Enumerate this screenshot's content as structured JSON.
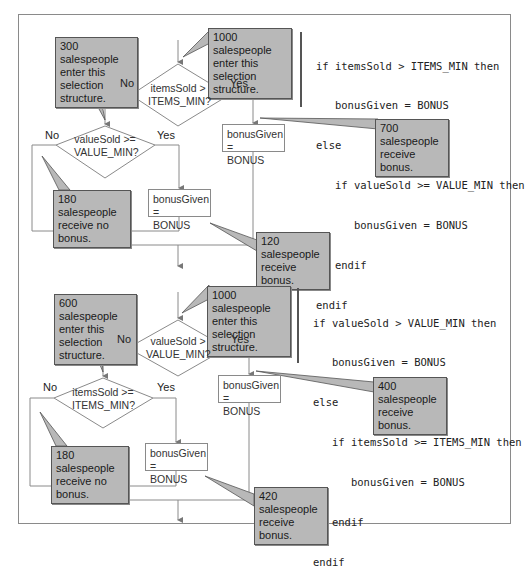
{
  "diagram_top": {
    "entry_callout": "1000 salespeople enter this selection structure.",
    "outer_condition": "itemsSold > ITEMS_MIN?",
    "outer_condition_lines": [
      "itemsSold >",
      "ITEMS_MIN?"
    ],
    "outer_no": "No",
    "outer_yes": "Yes",
    "outer_yes_action_lines": [
      "bonusGiven =",
      "BONUS"
    ],
    "outer_yes_callout_lines": [
      "700 salespeople",
      "receive bonus."
    ],
    "inner_entry_callout_lines": [
      "300 salespeople",
      "enter this selection",
      "structure."
    ],
    "inner_condition_lines": [
      "valueSold >=",
      "VALUE_MIN?"
    ],
    "inner_no": "No",
    "inner_yes": "Yes",
    "inner_yes_action_lines": [
      "bonusGiven =",
      "BONUS"
    ],
    "inner_no_callout_lines": [
      "180 salespeople",
      "receive no bonus."
    ],
    "inner_yes_callout_lines": [
      "120 salespeople",
      "receive bonus."
    ],
    "entry_callout_lines": [
      "1000 salespeople",
      "enter this selection",
      "structure."
    ],
    "pseudocode": [
      "if itemsSold > ITEMS_MIN then",
      "   bonusGiven = BONUS",
      "else",
      "   if valueSold >= VALUE_MIN then",
      "      bonusGiven = BONUS",
      "   endif",
      "endif"
    ]
  },
  "diagram_bottom": {
    "entry_callout_lines": [
      "1000 salespeople",
      "enter this selection",
      "structure."
    ],
    "outer_condition_lines": [
      "valueSold >",
      "VALUE_MIN?"
    ],
    "outer_no": "No",
    "outer_yes": "Yes",
    "outer_yes_action_lines": [
      "bonusGiven =",
      "BONUS"
    ],
    "outer_yes_callout_lines": [
      "400 salespeople",
      "receive bonus."
    ],
    "inner_entry_callout_lines": [
      "600 salespeople",
      "enter this selection",
      "structure."
    ],
    "inner_condition_lines": [
      "itemsSold >=",
      "ITEMS_MIN?"
    ],
    "inner_no": "No",
    "inner_yes": "Yes",
    "inner_yes_action_lines": [
      "bonusGiven =",
      "BONUS"
    ],
    "inner_no_callout_lines": [
      "180 salespeople",
      "receive no bonus."
    ],
    "inner_yes_callout_lines": [
      "420 salespeople",
      "receive bonus."
    ],
    "pseudocode": [
      "if valueSold > VALUE_MIN then",
      "   bonusGiven = BONUS",
      "else",
      "   if itemsSold >= ITEMS_MIN then",
      "      bonusGiven = BONUS",
      "   endif",
      "endif"
    ]
  },
  "colors": {
    "callout_fill": "#b8b8b8",
    "line": "#8a8a8a",
    "frame": "#8a8a8a"
  }
}
